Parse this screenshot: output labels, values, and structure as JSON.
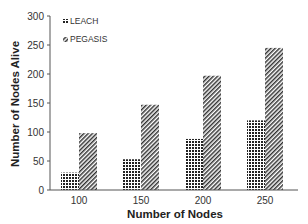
{
  "chart_data": {
    "type": "bar",
    "title": "",
    "xlabel": "Number of Nodes",
    "ylabel": "Number of Nodes Alive",
    "categories": [
      "100",
      "150",
      "200",
      "250"
    ],
    "series": [
      {
        "name": "LEACH",
        "pattern": "checker",
        "values": [
          30,
          53,
          88,
          120
        ]
      },
      {
        "name": "PEGASIS",
        "pattern": "diagonal-hatch",
        "values": [
          98,
          147,
          197,
          245
        ]
      }
    ],
    "ylim": [
      0,
      300
    ],
    "yticks": [
      0,
      50,
      100,
      150,
      200,
      250,
      300
    ],
    "grid": false,
    "legend_position": "top-left"
  },
  "legend": {
    "items": [
      {
        "label": "LEACH",
        "icon": "checker-pattern-icon"
      },
      {
        "label": "PEGASIS",
        "icon": "hatch-pattern-icon"
      }
    ]
  },
  "colors": {
    "axis": "#555555",
    "bar_fill": "#333333",
    "background": "#ffffff"
  }
}
